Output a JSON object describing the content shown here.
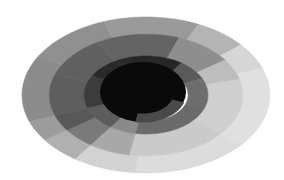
{
  "diagram": {
    "type": "elliptical-sunburst",
    "background": "#ffffff",
    "center": {
      "cx": 146,
      "cy": 95
    },
    "scale": {
      "rx": 124,
      "ry": 78
    },
    "core": {
      "rx": 43,
      "ry": 30,
      "cx": 143,
      "cy": 92,
      "color": "#0a0a0a",
      "notch": {
        "start_deg": 20,
        "end_deg": 100,
        "ring_radius": 0.72,
        "color": "#4a4a4a"
      }
    },
    "rings": [
      {
        "name": "ring-1",
        "inner": 0.34,
        "outer": 0.5,
        "segments": [
          {
            "start": -200,
            "end": -150,
            "color": "#3c3c3c"
          },
          {
            "start": -150,
            "end": -105,
            "color": "#2a2a2a"
          },
          {
            "start": -105,
            "end": -55,
            "color": "#262626"
          },
          {
            "start": -55,
            "end": -25,
            "color": "#5a5a5a"
          },
          {
            "start": -25,
            "end": 20,
            "color": "#6e6e6e"
          },
          {
            "start": 20,
            "end": 100,
            "color": "#6a6a6a"
          },
          {
            "start": 100,
            "end": 125,
            "color": "#8a8a8a"
          },
          {
            "start": 125,
            "end": 160,
            "color": "#5c5c5c"
          }
        ]
      },
      {
        "name": "ring-2",
        "inner": 0.5,
        "outer": 0.78,
        "segments": [
          {
            "start": -200,
            "end": -160,
            "color": "#5e5e5e"
          },
          {
            "start": -160,
            "end": -120,
            "color": "#606060"
          },
          {
            "start": -120,
            "end": -70,
            "color": "#646464"
          },
          {
            "start": -70,
            "end": -35,
            "color": "#8e8e8e"
          },
          {
            "start": -35,
            "end": -15,
            "color": "#bdbdbd"
          },
          {
            "start": -15,
            "end": 40,
            "color": "#cfcfcf"
          },
          {
            "start": 40,
            "end": 100,
            "color": "#cacaca"
          },
          {
            "start": 100,
            "end": 125,
            "color": "#a8a8a8"
          },
          {
            "start": 125,
            "end": 145,
            "color": "#7a7a7a"
          },
          {
            "start": 145,
            "end": 160,
            "color": "#585858"
          }
        ]
      },
      {
        "name": "ring-3",
        "inner": 0.78,
        "outer": 1.0,
        "segments": [
          {
            "start": -200,
            "end": -150,
            "color": "#8c8c8c"
          },
          {
            "start": -150,
            "end": -110,
            "color": "#909090"
          },
          {
            "start": -110,
            "end": -65,
            "color": "#9a9a9a"
          },
          {
            "start": -65,
            "end": -40,
            "color": "#b4b4b4"
          },
          {
            "start": -40,
            "end": -20,
            "color": "#d6d6d6"
          },
          {
            "start": -20,
            "end": 40,
            "color": "#e0e0e0"
          },
          {
            "start": 40,
            "end": 95,
            "color": "#dcdcdc"
          },
          {
            "start": 95,
            "end": 125,
            "color": "#d2d2d2"
          },
          {
            "start": 125,
            "end": 145,
            "color": "#b0b0b0"
          },
          {
            "start": 145,
            "end": 160,
            "color": "#9c9c9c"
          }
        ]
      }
    ]
  }
}
